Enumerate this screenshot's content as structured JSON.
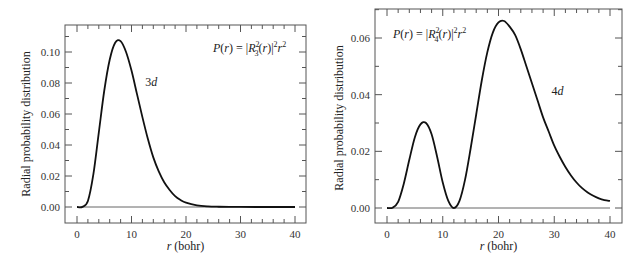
{
  "chart_data": [
    {
      "type": "line",
      "title": "",
      "formula": {
        "pre": "P(r) = |R",
        "sup": "2",
        "sub": "3",
        "post": "(r)|",
        "sup2": "2",
        "r": "r",
        "sup3": "2"
      },
      "xlabel": "r (bohr)",
      "ylabel": "Radial probability distribution",
      "xlim": [
        0,
        40
      ],
      "ylim": [
        -0.008,
        0.117
      ],
      "xticks": [
        0,
        10,
        20,
        30,
        40
      ],
      "xtick_labels": [
        "0",
        "10",
        "20",
        "30",
        "40"
      ],
      "yticks": [
        0.0,
        0.02,
        0.04,
        0.06,
        0.08,
        0.1
      ],
      "ytick_labels": [
        "0.00",
        "0.02",
        "0.04",
        "0.06",
        "0.08",
        "0.10"
      ],
      "grid": false,
      "series": [
        {
          "name": "3d",
          "label": "3d",
          "x": [
            0,
            1,
            2,
            3,
            4,
            5,
            6,
            7,
            8,
            9,
            10,
            11,
            12,
            13,
            14,
            15,
            16,
            17,
            18,
            19,
            20,
            22,
            24,
            26,
            28,
            30,
            35,
            40
          ],
          "y": [
            0,
            0.0001,
            0.0039,
            0.021,
            0.048,
            0.075,
            0.095,
            0.106,
            0.107,
            0.1,
            0.088,
            0.073,
            0.058,
            0.044,
            0.032,
            0.023,
            0.016,
            0.011,
            0.007,
            0.0045,
            0.0028,
            0.0011,
            0.0004,
            0.00015,
            5e-05,
            2e-05,
            0,
            0
          ]
        }
      ],
      "annotations": [
        {
          "text": "3d",
          "x": 12.5,
          "y": 0.078
        }
      ]
    },
    {
      "type": "line",
      "title": "",
      "formula": {
        "pre": "P(r) = |R",
        "sup": "2",
        "sub": "4",
        "post": "(r)|",
        "sup2": "2",
        "r": "r",
        "sup3": "2"
      },
      "xlabel": "r (bohr)",
      "ylabel": "Radial probability distribution",
      "xlim": [
        0,
        40
      ],
      "ylim": [
        -0.005,
        0.071
      ],
      "xticks": [
        0,
        10,
        20,
        30,
        40
      ],
      "xtick_labels": [
        "0",
        "10",
        "20",
        "30",
        "40"
      ],
      "yticks": [
        0.0,
        0.02,
        0.04,
        0.06
      ],
      "ytick_labels": [
        "0.00",
        "0.02",
        "0.04",
        "0.06"
      ],
      "grid": false,
      "series": [
        {
          "name": "4d",
          "label": "4d",
          "x": [
            0,
            1,
            2,
            3,
            4,
            5,
            6,
            7,
            8,
            9,
            10,
            11,
            12,
            13,
            14,
            15,
            16,
            17,
            18,
            19,
            20,
            21,
            22,
            23,
            24,
            25,
            26,
            27,
            28,
            29,
            30,
            31,
            32,
            33,
            34,
            35,
            36,
            37,
            38,
            39,
            40
          ],
          "y": [
            0,
            0.0001,
            0.0022,
            0.0085,
            0.017,
            0.025,
            0.0295,
            0.03,
            0.026,
            0.018,
            0.009,
            0.0025,
            0.0,
            0.0025,
            0.01,
            0.021,
            0.033,
            0.045,
            0.055,
            0.062,
            0.0655,
            0.066,
            0.064,
            0.061,
            0.056,
            0.05,
            0.044,
            0.038,
            0.032,
            0.027,
            0.022,
            0.018,
            0.0145,
            0.0115,
            0.009,
            0.007,
            0.0055,
            0.0043,
            0.0034,
            0.0028,
            0.0025
          ]
        }
      ],
      "annotations": [
        {
          "text": "4d",
          "x": 29.5,
          "y": 0.04
        }
      ]
    }
  ]
}
